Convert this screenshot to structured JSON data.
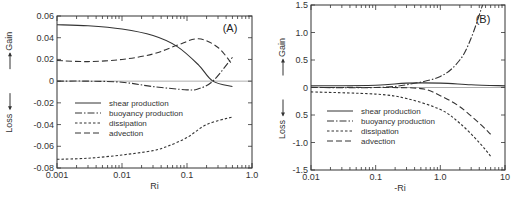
{
  "chart_data": [
    {
      "panel": "(A)",
      "type": "line",
      "xlabel": "Ri",
      "ylabel_gain": "Gain",
      "ylabel_loss": "Loss",
      "xscale": "log",
      "xlim": [
        0.001,
        1.0
      ],
      "ylim": [
        -0.008,
        0.006
      ],
      "xticks": [
        0.001,
        0.01,
        0.1,
        1.0
      ],
      "xtick_labels": [
        "0.001",
        "0.01",
        "0.1",
        "1.0"
      ],
      "yticks": [
        0.006,
        0.004,
        0.002,
        0,
        -0.002,
        -0.004,
        -0.006,
        -0.008
      ],
      "ytick_labels": [
        "0.06",
        "0.04",
        "0.02",
        "0",
        "-0.02",
        "-0.04",
        "-0.06",
        "-0.08"
      ],
      "zero_line": true,
      "grid": false,
      "legend_position": "lower-left inside",
      "series": [
        {
          "name": "shear production",
          "style": "solid",
          "x": [
            0.001,
            0.003,
            0.01,
            0.03,
            0.07,
            0.15,
            0.25,
            0.5
          ],
          "y": [
            0.0052,
            0.0051,
            0.0048,
            0.0042,
            0.0032,
            0.0015,
            0.0,
            -0.0005
          ]
        },
        {
          "name": "buoyancy production",
          "style": "dashdot",
          "x": [
            0.001,
            0.003,
            0.01,
            0.03,
            0.1,
            0.15,
            0.25,
            0.5
          ],
          "y": [
            0.0,
            0.0,
            -0.0001,
            -0.0005,
            -0.0008,
            -0.0007,
            0.0,
            0.0022
          ]
        },
        {
          "name": "dissipation",
          "style": "shortdash",
          "x": [
            0.001,
            0.003,
            0.01,
            0.03,
            0.05,
            0.1,
            0.2,
            0.5
          ],
          "y": [
            -0.0072,
            -0.0071,
            -0.0068,
            -0.0064,
            -0.006,
            -0.0052,
            -0.004,
            -0.0033
          ]
        },
        {
          "name": "advection",
          "style": "longdash",
          "x": [
            0.001,
            0.003,
            0.01,
            0.03,
            0.07,
            0.15,
            0.3,
            0.5
          ],
          "y": [
            0.0019,
            0.0018,
            0.002,
            0.0025,
            0.0033,
            0.0039,
            0.0031,
            0.0015
          ]
        }
      ]
    },
    {
      "panel": "(B)",
      "type": "line",
      "xlabel": "-Ri",
      "ylabel_gain": "Gain",
      "ylabel_loss": "Loss",
      "xscale": "log",
      "xlim": [
        0.01,
        10
      ],
      "ylim": [
        -1.5,
        1.5
      ],
      "xticks": [
        0.01,
        0.1,
        1.0,
        10
      ],
      "xtick_labels": [
        "0.01",
        "0.1",
        "1.0",
        "10"
      ],
      "yticks": [
        1.5,
        1.0,
        0.5,
        0,
        -0.5,
        -1.0,
        -1.5
      ],
      "ytick_labels": [
        "1.5",
        "1.0",
        "0.5",
        "0",
        "0.5",
        "-1.0",
        "-1.5"
      ],
      "zero_line": true,
      "grid": false,
      "legend_position": "lower-left inside",
      "series": [
        {
          "name": "shear production",
          "style": "solid",
          "x": [
            0.01,
            0.1,
            0.3,
            1.0,
            3.0,
            10
          ],
          "y": [
            0.03,
            0.04,
            0.08,
            0.08,
            0.05,
            0.03
          ]
        },
        {
          "name": "buoyancy production",
          "style": "dashdot",
          "x": [
            0.01,
            0.1,
            0.3,
            1.0,
            2.0,
            3.0,
            4.5
          ],
          "y": [
            0.0,
            0.0,
            0.05,
            0.2,
            0.5,
            0.9,
            1.5
          ]
        },
        {
          "name": "dissipation",
          "style": "shortdash",
          "x": [
            0.01,
            0.1,
            0.3,
            1.0,
            2.0,
            4.0,
            6.0
          ],
          "y": [
            -0.08,
            -0.12,
            -0.2,
            -0.4,
            -0.65,
            -1.0,
            -1.25
          ]
        },
        {
          "name": "advection",
          "style": "longdash",
          "x": [
            0.01,
            0.1,
            0.5,
            1.0,
            2.0,
            4.0,
            6.0
          ],
          "y": [
            0.0,
            0.0,
            -0.02,
            -0.15,
            -0.35,
            -0.65,
            -0.85
          ]
        }
      ]
    }
  ],
  "legend": {
    "items": [
      {
        "label": "shear production",
        "style": "solid"
      },
      {
        "label": "buoyancy production",
        "style": "dashdot"
      },
      {
        "label": "dissipation",
        "style": "shortdash"
      },
      {
        "label": "advection",
        "style": "longdash"
      }
    ]
  },
  "colors": {
    "ink": "#333333",
    "zero_line": "#999999",
    "background": "#ffffff"
  }
}
